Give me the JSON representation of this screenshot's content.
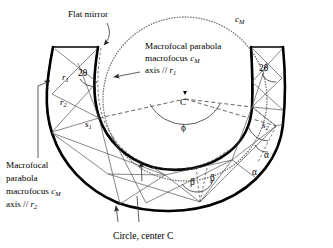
{
  "figure": {
    "background": "#ffffff",
    "ink": "#000000",
    "width": 333,
    "height": 248
  },
  "labels": {
    "flat_mirror": "Flat mirror",
    "macrofocal_r1": {
      "line1": "Macrofocal parabola",
      "line2_pre": "macrofocus ",
      "line2_sym": "c",
      "line2_sub": "M",
      "line3_pre": "axis // ",
      "line3_sym": "r",
      "line3_sub": "1"
    },
    "macrofocal_r2": {
      "line1": "Macrofocal",
      "line2": "parabola",
      "line3_pre": "macrofocus ",
      "line3_sym": "c",
      "line3_sub": "M",
      "line4_pre": "axis // ",
      "line4_sym": "r",
      "line4_sub": "2"
    },
    "circle_caption": "Circle, center C",
    "cm_curve": {
      "sym": "c",
      "sub": "M"
    },
    "center_point": "C"
  },
  "symbols": {
    "r1": {
      "sym": "r",
      "sub": "1"
    },
    "r2": {
      "sym": "r",
      "sub": "2"
    },
    "s1": {
      "sym": "s",
      "sub": "1"
    },
    "s2": {
      "sym": "s",
      "sub": "2"
    },
    "two_theta_left": "2θ",
    "two_theta_right": "2θ",
    "phi": "ϕ",
    "alpha_upper": "α",
    "alpha_lower": "α",
    "beta_left": "β",
    "beta_right": "β"
  }
}
